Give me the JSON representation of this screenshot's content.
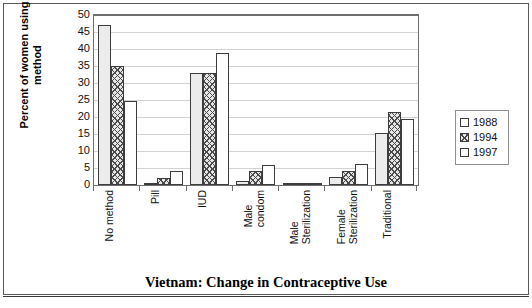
{
  "chart_data": {
    "type": "bar",
    "title": "Vietnam: Change in Contraceptive Use",
    "xlabel": "",
    "ylabel": "Percent of women using method",
    "ylim": [
      0,
      50
    ],
    "ytick_step": 5,
    "grid": true,
    "legend_position": "right",
    "categories": [
      "No method",
      "Pill",
      "IUD",
      "Male\ncondom",
      "Male\nSterilization",
      "Female\nSterilization",
      "Traditional"
    ],
    "yticks": [
      "0",
      "5",
      "10",
      "15",
      "20",
      "25",
      "30",
      "35",
      "40",
      "45",
      "50"
    ],
    "series": [
      {
        "name": "1988",
        "values": [
          47.0,
          0.5,
          33.0,
          1.2,
          0.2,
          2.5,
          15.4
        ]
      },
      {
        "name": "1994",
        "values": [
          35.0,
          2.0,
          33.0,
          4.0,
          0.3,
          4.0,
          21.6
        ]
      },
      {
        "name": "1997",
        "values": [
          24.8,
          4.2,
          38.7,
          6.0,
          0.5,
          6.3,
          19.5
        ]
      }
    ]
  },
  "legend": {
    "entries": [
      {
        "label": "1988",
        "swatch": "open-square"
      },
      {
        "label": "1994",
        "swatch": "hatched-square"
      },
      {
        "label": "1997",
        "swatch": "open-square"
      }
    ]
  },
  "caption": {
    "text": ""
  }
}
